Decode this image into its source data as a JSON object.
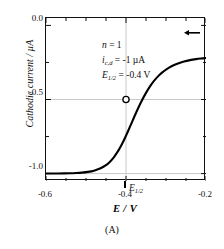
{
  "caption": "(A)",
  "chart_data": {
    "type": "line",
    "title": "",
    "xlabel": "E / V",
    "ylabel": "Cathodic current / µA",
    "xlim": [
      -0.6,
      -0.2
    ],
    "ylim": [
      -1.05,
      0.05
    ],
    "grid": true,
    "grid_color": "#c9c9c9",
    "curve_color": "#000000",
    "legend": "none",
    "xticks": [
      -0.6,
      -0.4,
      -0.2
    ],
    "xtick_labels": [
      "-0.6",
      "-0.4",
      "-0.2"
    ],
    "xminor_ticks": [
      -0.55,
      -0.5,
      -0.45,
      -0.35,
      -0.3,
      -0.25
    ],
    "yticks": [
      0.0,
      -0.5,
      -1.0
    ],
    "ytick_labels": [
      "0.0",
      "-0.5",
      "-1.0"
    ],
    "yminor_ticks": [
      -0.25,
      -0.75
    ],
    "gridlines_x": [
      -0.4
    ],
    "gridlines_y": [
      -0.5,
      -1.0
    ],
    "series": [
      {
        "name": "polarographic wave",
        "x": [
          -0.6,
          -0.585,
          -0.57,
          -0.555,
          -0.54,
          -0.525,
          -0.51,
          -0.495,
          -0.48,
          -0.465,
          -0.45,
          -0.44,
          -0.43,
          -0.42,
          -0.415,
          -0.41,
          -0.405,
          -0.4,
          -0.395,
          -0.39,
          -0.385,
          -0.38,
          -0.37,
          -0.36,
          -0.35,
          -0.34,
          -0.33,
          -0.32,
          -0.31,
          -0.3,
          -0.285,
          -0.27,
          -0.255,
          -0.24,
          -0.225,
          -0.21,
          -0.2
        ],
        "y": [
          -0.9997,
          -0.9996,
          -0.9993,
          -0.9988,
          -0.9979,
          -0.9963,
          -0.9935,
          -0.9886,
          -0.9803,
          -0.9661,
          -0.9427,
          -0.9194,
          -0.8885,
          -0.8487,
          -0.8254,
          -0.8,
          -0.7729,
          -0.7441,
          -0.7141,
          -0.6833,
          -0.6522,
          -0.6213,
          -0.5611,
          -0.5053,
          -0.4553,
          -0.4118,
          -0.3749,
          -0.344,
          -0.3187,
          -0.298,
          -0.274,
          -0.2564,
          -0.2435,
          -0.2341,
          -0.2273,
          -0.2224,
          -0.2199
        ]
      }
    ],
    "markers": [
      {
        "name": "half-wave-point",
        "x": -0.4,
        "y": -0.5,
        "style": "open-circle",
        "facecolor": "#ffffff",
        "edgecolor": "#000000"
      }
    ],
    "annotations": {
      "in_plot": [
        {
          "symbol": "n",
          "subscript": "",
          "text": " = 1"
        },
        {
          "symbol": "i",
          "subscript": "c,d",
          "text": " = -1 µA"
        },
        {
          "symbol": "E",
          "subscript": "1/2",
          "text": " = -0.4 V"
        }
      ],
      "axis_marker": {
        "symbol": "E",
        "subscript": "1/2",
        "x": -0.4
      },
      "arrow": {
        "name": "limiting-current-arrow",
        "direction": "left",
        "x_start": -0.215,
        "x_end": -0.255,
        "y": -0.05
      }
    }
  }
}
